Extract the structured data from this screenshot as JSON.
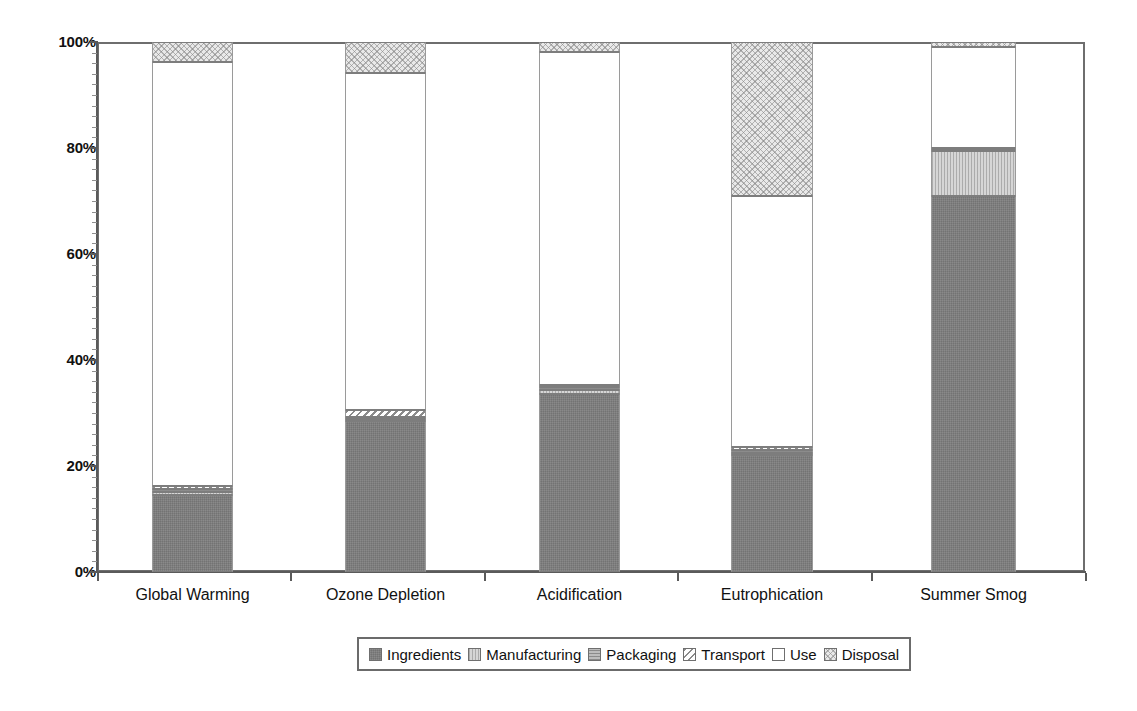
{
  "chart_data": {
    "type": "bar",
    "subtype": "stacked-100-percent",
    "title": "",
    "subtitle": "",
    "xlabel": "",
    "ylabel": "",
    "ylim": [
      0,
      100
    ],
    "ytick_labels": [
      "0%",
      "20%",
      "40%",
      "60%",
      "80%",
      "100%"
    ],
    "ytick_values": [
      0,
      20,
      40,
      60,
      80,
      100
    ],
    "grid": false,
    "legend_position": "bottom-center",
    "categories": [
      "Global Warming",
      "Ozone Depletion",
      "Acidification",
      "Eutrophication",
      "Summer Smog"
    ],
    "series": [
      {
        "name": "Ingredients",
        "values": [
          14.5,
          28.5,
          33.6,
          22.0,
          71.0
        ]
      },
      {
        "name": "Manufacturing",
        "values": [
          0.6,
          0.4,
          0.7,
          0.5,
          8.5
        ]
      },
      {
        "name": "Packaging",
        "values": [
          0.6,
          0.4,
          0.6,
          0.6,
          0.3
        ]
      },
      {
        "name": "Transport",
        "values": [
          0.5,
          1.3,
          0.4,
          0.4,
          0.2
        ]
      },
      {
        "name": "Use",
        "values": [
          80.0,
          63.6,
          62.8,
          47.5,
          19.0
        ]
      },
      {
        "name": "Disposal",
        "values": [
          3.8,
          5.8,
          1.9,
          29.0,
          1.0
        ]
      }
    ],
    "series_patterns": [
      "solid-dark-grey",
      "light-grey-vertical-hatch",
      "mid-grey-horizontal-hatch",
      "diagonal-hatch",
      "white-empty",
      "light-grey-crosshatch"
    ],
    "series_colors": [
      "#7e7e7e",
      "#d6d6d6",
      "#bdbdbd",
      "#ededed",
      "#ffffff",
      "#e9e9e9"
    ]
  },
  "axes": {
    "y_ticks": [
      {
        "label": "100%",
        "value": 100
      },
      {
        "label": "80%",
        "value": 80
      },
      {
        "label": "60%",
        "value": 60
      },
      {
        "label": "40%",
        "value": 40
      },
      {
        "label": "20%",
        "value": 20
      },
      {
        "label": "0%",
        "value": 0
      }
    ]
  },
  "legend": {
    "items": [
      {
        "label": "Ingredients",
        "swatch": "legend-swatch-ingredients"
      },
      {
        "label": "Manufacturing",
        "swatch": "legend-swatch-manufacturing"
      },
      {
        "label": "Packaging",
        "swatch": "legend-swatch-packaging"
      },
      {
        "label": "Transport",
        "swatch": "legend-swatch-transport"
      },
      {
        "label": "Use",
        "swatch": "legend-swatch-use"
      },
      {
        "label": "Disposal",
        "swatch": "legend-swatch-disposal"
      }
    ]
  }
}
